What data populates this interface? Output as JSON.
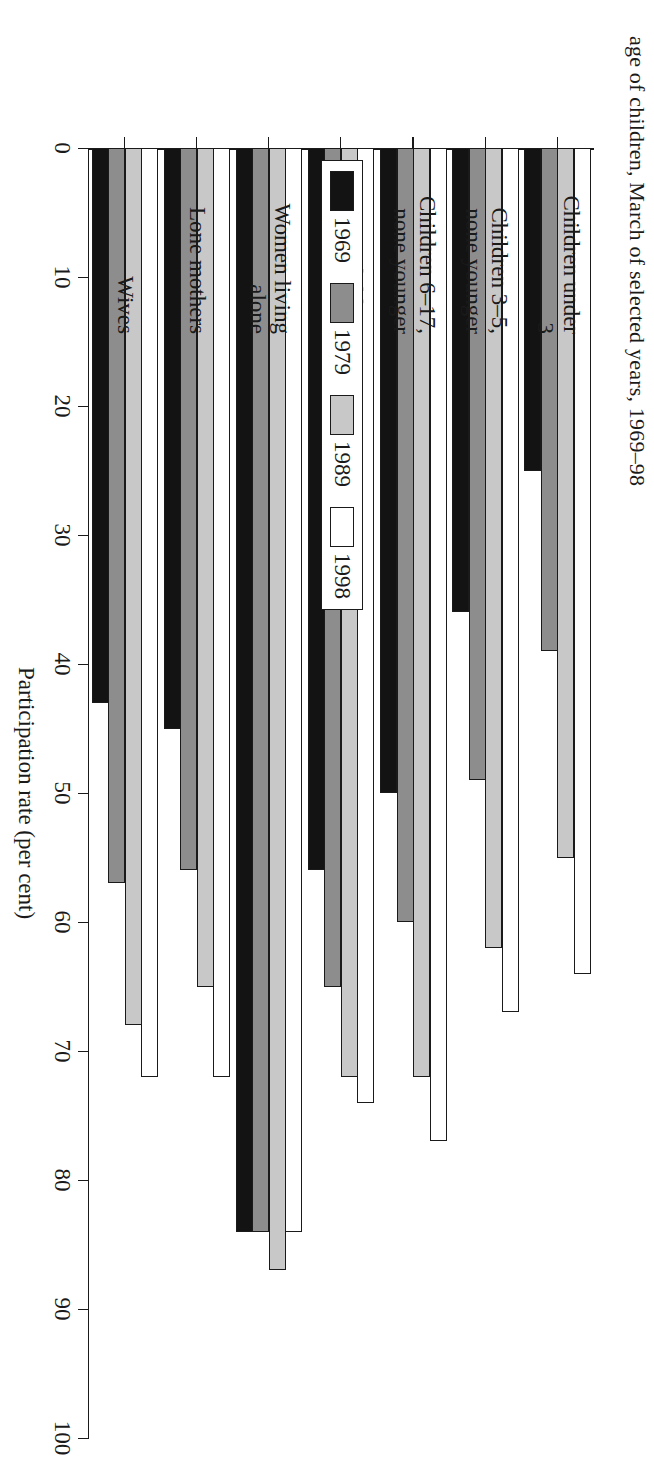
{
  "figure": {
    "title": "age of children, March of selected years, 1969–98"
  },
  "axis": {
    "value_title": "Participation rate (per cent)",
    "ticks": [
      "0",
      "10",
      "20",
      "30",
      "40",
      "50",
      "60",
      "70",
      "80",
      "90",
      "100"
    ]
  },
  "legend": {
    "items": [
      {
        "label": "1969",
        "color": "#131313"
      },
      {
        "label": "1979",
        "color": "#8d8d8d"
      },
      {
        "label": "1989",
        "color": "#c8c8c8"
      },
      {
        "label": "1998",
        "color": "#ffffff"
      }
    ]
  },
  "chart_data": {
    "type": "bar",
    "title": "age of children, March of selected years, 1969–98",
    "xlabel": "",
    "ylabel": "Participation rate (per cent)",
    "ylim": [
      0,
      100
    ],
    "grid": false,
    "legend_position": "bottom-right",
    "orientation": "horizontal",
    "categories": [
      "Wives",
      "Lone mothers",
      "Women living alone",
      "No children under 18",
      "Children 6–17, none younger",
      "Children 3–5, none younger",
      "Children under 3"
    ],
    "category_lines": [
      [
        "Wives"
      ],
      [
        "Lone mothers"
      ],
      [
        "Women living",
        "alone"
      ],
      [
        "No children",
        "under 18"
      ],
      [
        "Children 6–17,",
        "none younger"
      ],
      [
        "Children 3–5,",
        "none younger"
      ],
      [
        "Children under",
        "3"
      ]
    ],
    "series": [
      {
        "name": "1969",
        "color": "#131313",
        "values": [
          43,
          45,
          84,
          56,
          50,
          36,
          25
        ]
      },
      {
        "name": "1979",
        "color": "#8d8d8d",
        "values": [
          57,
          56,
          84,
          65,
          60,
          49,
          39
        ]
      },
      {
        "name": "1989",
        "color": "#c8c8c8",
        "values": [
          68,
          65,
          87,
          72,
          72,
          62,
          55
        ]
      },
      {
        "name": "1998",
        "color": "#ffffff",
        "values": [
          72,
          72,
          84,
          74,
          77,
          67,
          64
        ]
      }
    ]
  }
}
